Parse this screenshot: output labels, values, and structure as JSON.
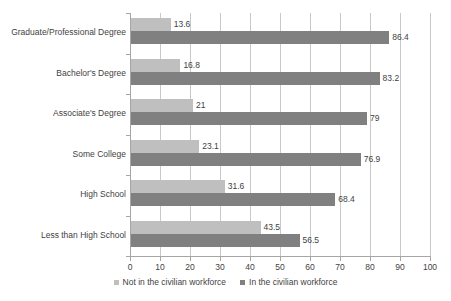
{
  "chart_data": {
    "type": "bar",
    "orientation": "horizontal",
    "title": "",
    "xlabel": "",
    "ylabel": "",
    "xlim": [
      0,
      100
    ],
    "xticks": [
      0,
      10,
      20,
      30,
      40,
      50,
      60,
      70,
      80,
      90,
      100
    ],
    "xtick_labels": [
      "0",
      "10",
      "20",
      "30",
      "40",
      "50",
      "60",
      "70",
      "80",
      "90",
      "100"
    ],
    "grid": true,
    "grid_axis": "x",
    "legend_position": "bottom",
    "categories": [
      "Graduate/Professional Degree",
      "Bachelor's Degree",
      "Associate's Degree",
      "Some College",
      "High School",
      "Less than High School"
    ],
    "series": [
      {
        "name": "Not in the civilian workforce",
        "color": "#bfbfbf",
        "values": [
          13.6,
          16.8,
          21,
          23.1,
          31.6,
          43.5
        ],
        "labels": [
          "13.6",
          "16.8",
          "21",
          "23.1",
          "31.6",
          "43.5"
        ]
      },
      {
        "name": "In the civilian workforce",
        "color": "#808080",
        "values": [
          86.4,
          83.2,
          79,
          76.9,
          68.4,
          56.5
        ],
        "labels": [
          "86.4",
          "83.2",
          "79",
          "76.9",
          "68.4",
          "56.5"
        ]
      }
    ]
  },
  "legend": {
    "items": [
      {
        "label": "Not in the civilian workforce",
        "color": "#bfbfbf"
      },
      {
        "label": "In the civilian workforce",
        "color": "#808080"
      }
    ]
  },
  "colors": {
    "series_light": "#bfbfbf",
    "series_dark": "#808080",
    "gridline": "#c9c9c9",
    "axis": "#a6a6a6",
    "text": "#3f3f3f",
    "background": "#ffffff"
  }
}
